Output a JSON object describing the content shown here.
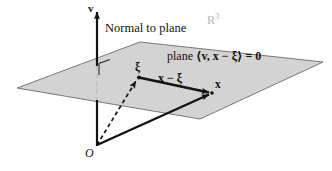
{
  "figure": {
    "background_color": "#ffffff",
    "ink_color": "#15120f",
    "plane_fill": "#cfcfcf",
    "plane_stroke": "#5a5a5a",
    "faint_color": "#b9b7b5",
    "width": 332,
    "height": 171
  },
  "labels": {
    "normal_axis": "v",
    "normal_caption": "Normal to plane",
    "space": "R",
    "space_exponent": "3",
    "plane_equation_prefix": "plane",
    "plane_equation": "⟨v, x − ξ⟩ = 0",
    "foot_point": "ξ",
    "difference_vector": "x − ξ",
    "point_x": "x",
    "origin": "O"
  },
  "plane": {
    "corners": [
      {
        "name": "left",
        "x": 17,
        "y": 88
      },
      {
        "name": "top",
        "x": 140,
        "y": 42
      },
      {
        "name": "right",
        "x": 323,
        "y": 62
      },
      {
        "name": "bottom",
        "x": 200,
        "y": 119
      }
    ]
  },
  "vectors": [
    {
      "name": "normal-axis",
      "label": "v",
      "style": "solid-arrow",
      "from": {
        "x": 97,
        "y": 145
      },
      "to": {
        "x": 97,
        "y": 8
      }
    },
    {
      "name": "origin-to-xi",
      "label": "ξ",
      "style": "dashed-arrow",
      "from": {
        "x": 97,
        "y": 145
      },
      "to": {
        "x": 139,
        "y": 77
      }
    },
    {
      "name": "origin-to-x",
      "label": "x",
      "style": "solid-arrow",
      "from": {
        "x": 97,
        "y": 145
      },
      "to": {
        "x": 213,
        "y": 93
      }
    },
    {
      "name": "xi-to-x",
      "label": "x − ξ",
      "style": "solid-arrow",
      "from": {
        "x": 139,
        "y": 77
      },
      "to": {
        "x": 213,
        "y": 93
      }
    }
  ],
  "right_angle_marker": {
    "name": "right-angle-at-axis",
    "x": 99,
    "y": 63,
    "size": 11
  }
}
